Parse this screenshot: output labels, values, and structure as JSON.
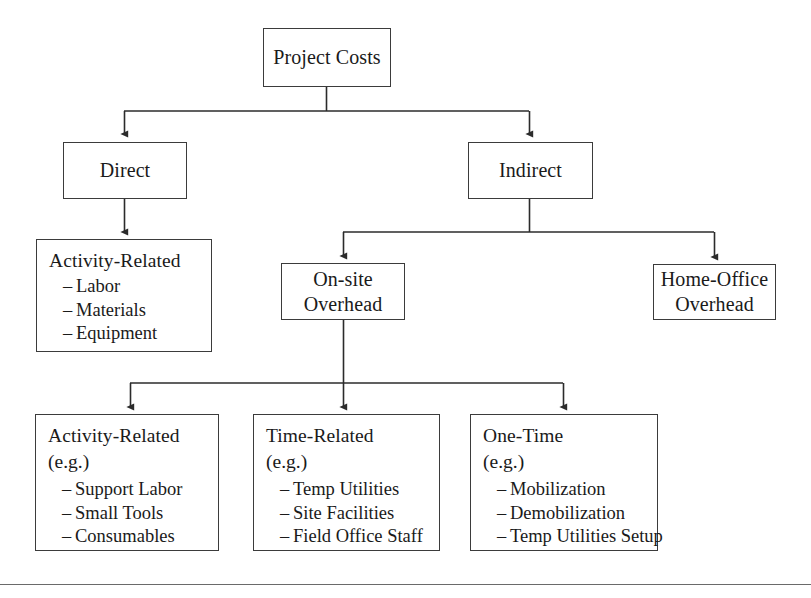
{
  "diagram": {
    "type": "hierarchical-tree",
    "title": "Project Costs",
    "nodes": {
      "root": {
        "label": "Project Costs"
      },
      "direct": {
        "label": "Direct"
      },
      "indirect": {
        "label": "Indirect"
      },
      "direct_activity": {
        "label": "Activity-Related",
        "items": [
          "Labor",
          "Materials",
          "Equipment"
        ]
      },
      "onsite": {
        "label": "On-site\nOverhead"
      },
      "homeoffice": {
        "label": "Home-Office\nOverhead"
      },
      "onsite_activity": {
        "label": "Activity-Related",
        "sub": "(e.g.)",
        "items": [
          "Support Labor",
          "Small Tools",
          "Consumables"
        ]
      },
      "onsite_time": {
        "label": "Time-Related",
        "sub": "(e.g.)",
        "items": [
          "Temp Utilities",
          "Site Facilities",
          "Field Office Staff"
        ]
      },
      "onsite_onetime": {
        "label": "One-Time",
        "sub": "(e.g.)",
        "items": [
          "Mobilization",
          "Demobilization",
          "Temp Utilities Setup"
        ]
      }
    },
    "list_marker": "–",
    "colors": {
      "box_border": "#3b3b3b",
      "connector": "#2b2b2b",
      "background": "#ffffff",
      "footer_rule": "#6a6a6a"
    }
  }
}
